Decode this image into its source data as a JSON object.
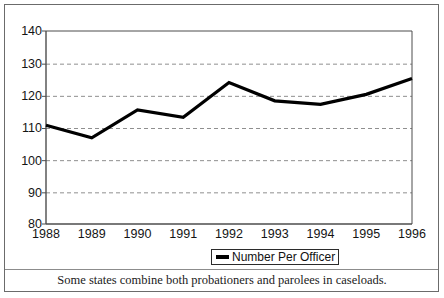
{
  "chart_data": {
    "type": "line",
    "title": "",
    "subtitle": "",
    "xlabel": "",
    "ylabel": "",
    "categories": [
      "1988",
      "1989",
      "1990",
      "1991",
      "1992",
      "1993",
      "1994",
      "1995",
      "1996"
    ],
    "series": [
      {
        "name": "Number Per Officer",
        "values": [
          110.7,
          106.8,
          115.5,
          113.2,
          124.0,
          118.3,
          117.2,
          120.3,
          125.2
        ],
        "color": "#000000"
      }
    ],
    "ylim": [
      80,
      140
    ],
    "yticks": [
      80,
      90,
      100,
      110,
      120,
      130,
      140
    ],
    "ytick_labels": [
      "80",
      "90",
      "100",
      "110",
      "120",
      "130",
      "140"
    ],
    "grid": true,
    "grid_axis": "y",
    "grid_style": "dashed",
    "grid_color": "#8f8f8f",
    "legend_position": "bottom-center",
    "footnote": "Some states combine both probationers and parolees in caseloads."
  },
  "legend": {
    "entries": [
      {
        "label": "Number Per Officer",
        "swatch": "line-swatch"
      }
    ]
  },
  "axes": {
    "y_labels": [
      "140",
      "130",
      "120",
      "110",
      "100",
      "90",
      "80"
    ],
    "x_labels": [
      "1988",
      "1989",
      "1990",
      "1991",
      "1992",
      "1993",
      "1994",
      "1995",
      "1996"
    ]
  },
  "footnote": {
    "text": "Some states combine both probationers and parolees in caseloads."
  },
  "colors": {
    "line": "#000000",
    "grid": "#8f8f8f",
    "axis": "#4d4d4d",
    "frame": "#6b6b6b",
    "text": "#141414",
    "background": "#ffffff"
  }
}
